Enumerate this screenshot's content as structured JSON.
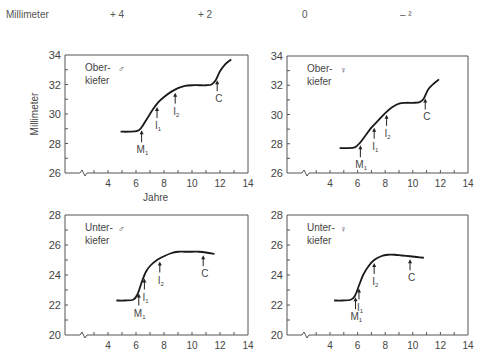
{
  "header": {
    "unit_label": "Millimeter",
    "columns": [
      "+ 4",
      "+ 2",
      "0",
      "– ²"
    ]
  },
  "chart_data": [
    {
      "type": "line",
      "panel": "top-left",
      "title": "Ober-\nkiefer",
      "sex_symbol": "♂",
      "xlabel": "Jahre",
      "ylabel": "Millimeter",
      "xlim": [
        2,
        14
      ],
      "ylim": [
        26,
        34
      ],
      "xticks": [
        4,
        6,
        8,
        10,
        12,
        14
      ],
      "yticks": [
        26,
        28,
        30,
        32,
        34
      ],
      "axis_break": true,
      "grid": false,
      "series": [
        {
          "name": "Oberkiefer ♂",
          "x": [
            4.9,
            5.5,
            6.1,
            6.4,
            6.8,
            7.2,
            7.6,
            8.0,
            8.5,
            9.0,
            9.5,
            10.0,
            10.5,
            11.0,
            11.4,
            11.7,
            12.0,
            12.4,
            12.8
          ],
          "y": [
            28.8,
            28.8,
            28.85,
            29.1,
            29.7,
            30.3,
            30.8,
            31.15,
            31.5,
            31.75,
            31.9,
            31.95,
            31.95,
            31.95,
            32.0,
            32.3,
            32.9,
            33.4,
            33.7
          ]
        }
      ],
      "annotations": [
        {
          "label": "M",
          "sub": "1",
          "x": 6.4
        },
        {
          "label": "I",
          "sub": "1",
          "x": 7.5
        },
        {
          "label": "I",
          "sub": "2",
          "x": 8.8
        },
        {
          "label": "C",
          "sub": "",
          "x": 11.8
        }
      ]
    },
    {
      "type": "line",
      "panel": "top-right",
      "title": "Ober-\nkiefer",
      "sex_symbol": "♀",
      "xlabel": "",
      "ylabel": "",
      "xlim": [
        2,
        14
      ],
      "ylim": [
        26,
        34
      ],
      "xticks": [
        4,
        6,
        8,
        10,
        12,
        14
      ],
      "yticks": [
        26,
        28,
        30,
        32,
        34
      ],
      "axis_break": true,
      "grid": false,
      "series": [
        {
          "name": "Oberkiefer ♀",
          "x": [
            4.7,
            5.2,
            5.8,
            6.2,
            6.6,
            7.0,
            7.5,
            8.0,
            8.5,
            9.0,
            9.5,
            10.0,
            10.5,
            10.8,
            11.1,
            11.5,
            11.9
          ],
          "y": [
            27.7,
            27.7,
            27.75,
            28.1,
            28.6,
            29.1,
            29.6,
            30.1,
            30.5,
            30.75,
            30.8,
            30.8,
            30.85,
            31.1,
            31.7,
            32.1,
            32.4
          ]
        }
      ],
      "annotations": [
        {
          "label": "M",
          "sub": "1",
          "x": 6.2
        },
        {
          "label": "I",
          "sub": "1",
          "x": 7.2
        },
        {
          "label": "I",
          "sub": "2",
          "x": 8.1
        },
        {
          "label": "C",
          "sub": "",
          "x": 10.9
        }
      ]
    },
    {
      "type": "line",
      "panel": "bottom-left",
      "title": "Unter-\nkiefer",
      "sex_symbol": "♂",
      "xlabel": "",
      "ylabel": "",
      "xlim": [
        2,
        14
      ],
      "ylim": [
        20,
        28
      ],
      "xticks": [
        4,
        6,
        8,
        10,
        12,
        14
      ],
      "yticks": [
        20,
        22,
        24,
        26,
        28
      ],
      "axis_break": true,
      "grid": false,
      "series": [
        {
          "name": "Unterkiefer ♂",
          "x": [
            4.6,
            5.2,
            5.8,
            6.1,
            6.4,
            6.7,
            7.0,
            7.5,
            8.0,
            8.5,
            9.0,
            9.5,
            10.0,
            10.5,
            11.0,
            11.6
          ],
          "y": [
            22.3,
            22.3,
            22.35,
            22.7,
            23.5,
            24.2,
            24.6,
            25.0,
            25.25,
            25.45,
            25.55,
            25.55,
            25.55,
            25.55,
            25.5,
            25.4
          ]
        }
      ],
      "annotations": [
        {
          "label": "M",
          "sub": "1",
          "x": 6.2
        },
        {
          "label": "I",
          "sub": "1",
          "x": 6.6
        },
        {
          "label": "I",
          "sub": "2",
          "x": 7.7
        },
        {
          "label": "C",
          "sub": "",
          "x": 10.8
        }
      ]
    },
    {
      "type": "line",
      "panel": "bottom-right",
      "title": "Unter-\nkiefer",
      "sex_symbol": "♀",
      "xlabel": "",
      "ylabel": "",
      "xlim": [
        2,
        14
      ],
      "ylim": [
        20,
        28
      ],
      "xticks": [
        4,
        6,
        8,
        10,
        12,
        14
      ],
      "yticks": [
        20,
        22,
        24,
        26,
        28
      ],
      "axis_break": true,
      "grid": false,
      "series": [
        {
          "name": "Unterkiefer ♀",
          "x": [
            4.3,
            4.9,
            5.5,
            5.8,
            6.1,
            6.4,
            6.8,
            7.2,
            7.7,
            8.2,
            8.7,
            9.2,
            9.8,
            10.3,
            10.8
          ],
          "y": [
            22.3,
            22.3,
            22.35,
            22.6,
            23.3,
            24.0,
            24.6,
            25.0,
            25.25,
            25.35,
            25.35,
            25.3,
            25.25,
            25.2,
            25.15
          ]
        }
      ],
      "annotations": [
        {
          "label": "M",
          "sub": "1",
          "x": 5.85
        },
        {
          "label": "I",
          "sub": "1",
          "x": 6.1
        },
        {
          "label": "I",
          "sub": "2",
          "x": 7.2
        },
        {
          "label": "C",
          "sub": "",
          "x": 9.8
        }
      ]
    }
  ],
  "layout": {
    "header_x": [
      6,
      110,
      198,
      302,
      400
    ],
    "panels": [
      {
        "left": 65,
        "right": 248,
        "top": 55,
        "bottom": 173
      },
      {
        "left": 287,
        "right": 468,
        "top": 56,
        "bottom": 173
      },
      {
        "left": 65,
        "right": 248,
        "top": 215,
        "bottom": 335
      },
      {
        "left": 287,
        "right": 468,
        "top": 215,
        "bottom": 335
      }
    ],
    "line_color": "#1a1a1a",
    "axis_color": "#555555"
  }
}
